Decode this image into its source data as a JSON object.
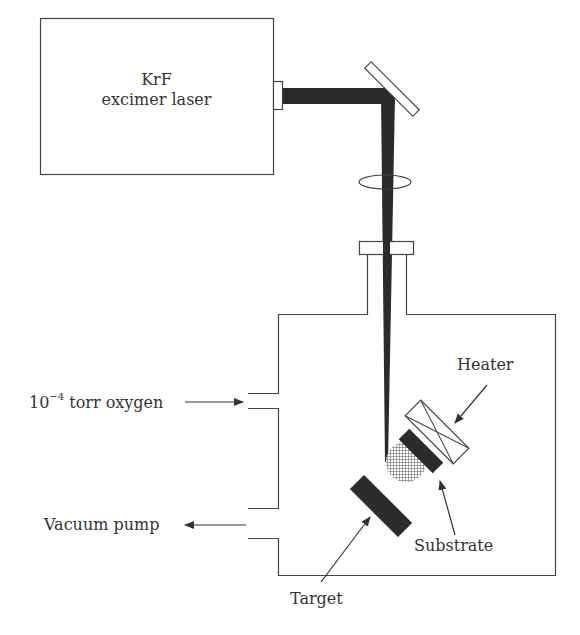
{
  "diagram": {
    "type": "schematic",
    "laser": {
      "line1": "KrF",
      "line2": "excimer laser"
    },
    "labels": {
      "oxygen_base": "10",
      "oxygen_exp": "−4",
      "oxygen_rest": " torr oxygen",
      "vacuum_pump": "Vacuum pump",
      "heater": "Heater",
      "substrate": "Substrate",
      "target": "Target"
    },
    "components": [
      "laser",
      "output-port",
      "mirror",
      "lens",
      "window",
      "vacuum-chamber",
      "target",
      "plume",
      "substrate",
      "heater",
      "gas-inlet",
      "pump-outlet"
    ],
    "colors": {
      "line": "#444444",
      "beam": "#2b2b2b",
      "solid": "#2b2b2b",
      "text": "#333333"
    }
  }
}
